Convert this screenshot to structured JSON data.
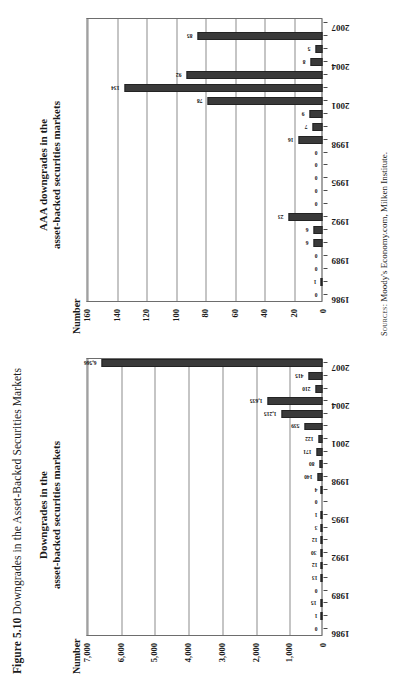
{
  "figure": {
    "number": "Figure 5.10",
    "caption": "Downgrades in the Asset-Backed Securities Markets"
  },
  "source": {
    "prefix": "Sources:",
    "text": "Moody's Economy.com, Milken Institute."
  },
  "panels": {
    "left": {
      "title_line1": "Downgrades in the",
      "title_line2": "asset-backed securities markets",
      "axis_label": "Number"
    },
    "right": {
      "title_line1": "AAA downgrades in the",
      "title_line2": "asset-backed securities markets",
      "axis_label": "Number"
    }
  },
  "chart_data": [
    {
      "type": "bar",
      "title": "Downgrades in the asset-backed securities markets",
      "xlabel": "",
      "ylabel": "Number",
      "orientation": "vertical",
      "grid": true,
      "legend": "none",
      "ylim": [
        0,
        7000
      ],
      "yticks": [
        "0",
        "1,000",
        "2,000",
        "3,000",
        "4,000",
        "5,000",
        "6,000",
        "7,000"
      ],
      "ytick_values": [
        0,
        1000,
        2000,
        3000,
        4000,
        5000,
        6000,
        7000
      ],
      "categories": [
        "1986",
        "1987",
        "1988",
        "1989",
        "1990",
        "1991",
        "1992",
        "1993",
        "1994",
        "1995",
        "1996",
        "1997",
        "1998",
        "1999",
        "2000",
        "2001",
        "2002",
        "2003",
        "2004",
        "2005",
        "2006",
        "2007"
      ],
      "xtick_labels": [
        "1986",
        "1989",
        "1992",
        "1995",
        "1998",
        "2001",
        "2004",
        "2007"
      ],
      "values": [
        0,
        1,
        15,
        0,
        13,
        12,
        30,
        12,
        3,
        1,
        0,
        4,
        140,
        80,
        171,
        122,
        539,
        1215,
        1635,
        210,
        415,
        6566
      ],
      "data_labels": [
        "0",
        "1",
        "15",
        "0",
        "13",
        "12",
        "30",
        "12",
        "3",
        "1",
        "0",
        "4",
        "140",
        "80",
        "171",
        "122",
        "539",
        "1,215",
        "1,635",
        "210",
        "415",
        "6,566"
      ]
    },
    {
      "type": "bar",
      "title": "AAA downgrades in the asset-backed securities markets",
      "xlabel": "",
      "ylabel": "Number",
      "orientation": "vertical",
      "grid": true,
      "legend": "none",
      "ylim": [
        0,
        160
      ],
      "yticks": [
        "0",
        "20",
        "40",
        "60",
        "80",
        "100",
        "120",
        "140",
        "160"
      ],
      "ytick_values": [
        0,
        20,
        40,
        60,
        80,
        100,
        120,
        140,
        160
      ],
      "categories": [
        "1986",
        "1987",
        "1988",
        "1989",
        "1990",
        "1991",
        "1992",
        "1993",
        "1994",
        "1995",
        "1996",
        "1997",
        "1998",
        "1999",
        "2000",
        "2001",
        "2002",
        "2003",
        "2004",
        "2005",
        "2006",
        "2007"
      ],
      "xtick_labels": [
        "1986",
        "1989",
        "1992",
        "1995",
        "1998",
        "2001",
        "2004",
        "2007"
      ],
      "values": [
        0,
        1,
        0,
        0,
        6,
        6,
        23,
        0,
        0,
        0,
        0,
        0,
        16,
        7,
        9,
        78,
        134,
        92,
        8,
        5,
        85,
        0
      ],
      "data_labels": [
        "0",
        "1",
        "0",
        "0",
        "6",
        "6",
        "23",
        "0",
        "0",
        "0",
        "0",
        "0",
        "16",
        "7",
        "9",
        "78",
        "134",
        "92",
        "8",
        "5",
        "85",
        ""
      ]
    }
  ],
  "colors": {
    "bar_fill": "#3a3a3a",
    "axis": "#4a4a4a",
    "grid": "#8b8b8b",
    "text": "#1a1a1a",
    "background": "#ffffff"
  }
}
